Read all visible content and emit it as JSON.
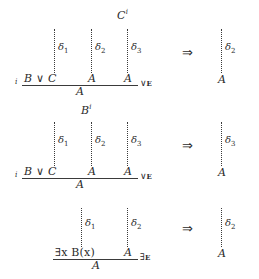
{
  "figure": {
    "kind": "natural-deduction-reduction-diagram",
    "symbols": {
      "reduces_to": "⇒",
      "or": "∨",
      "exists": "∃",
      "delta": "δ"
    },
    "sections": [
      {
        "id": "or-elim-left",
        "left": {
          "discharge_index": "i",
          "open_assumption": {
            "text": "C",
            "superscript": "i"
          },
          "derivations": [
            {
              "label": "δ",
              "subscript": "1"
            },
            {
              "label": "δ",
              "subscript": "2"
            },
            {
              "label": "δ",
              "subscript": "3"
            }
          ],
          "premises": [
            "B ∨ C",
            "A",
            "A"
          ],
          "conclusion": "A",
          "rule": {
            "connective": "∨",
            "elim": "E"
          }
        },
        "right": {
          "derivation": {
            "label": "δ",
            "subscript": "2"
          },
          "conclusion": "A"
        }
      },
      {
        "id": "or-elim-right",
        "left": {
          "discharge_index": "i",
          "open_assumption": {
            "text": "B",
            "superscript": "i"
          },
          "derivations": [
            {
              "label": "δ",
              "subscript": "1"
            },
            {
              "label": "δ",
              "subscript": "2"
            },
            {
              "label": "δ",
              "subscript": "3"
            }
          ],
          "premises": [
            "B ∨ C",
            "A",
            "A"
          ],
          "conclusion": "A",
          "rule": {
            "connective": "∨",
            "elim": "E"
          }
        },
        "right": {
          "derivation": {
            "label": "δ",
            "subscript": "3"
          },
          "conclusion": "A"
        }
      },
      {
        "id": "exists-elim",
        "left": {
          "discharge_index": "",
          "open_assumption": null,
          "derivations": [
            {
              "label": "δ",
              "subscript": "1"
            },
            {
              "label": "δ",
              "subscript": "2"
            }
          ],
          "premises": [
            "∃x B(x)",
            "A"
          ],
          "conclusion": "A",
          "rule": {
            "connective": "∃",
            "elim": "E"
          }
        },
        "right": {
          "derivation": {
            "label": "δ",
            "subscript": "2"
          },
          "conclusion": "A"
        }
      }
    ],
    "colors": {
      "ink": "#2b2b2b",
      "rule_line": "#3a3a3a",
      "background": "#ffffff"
    }
  }
}
